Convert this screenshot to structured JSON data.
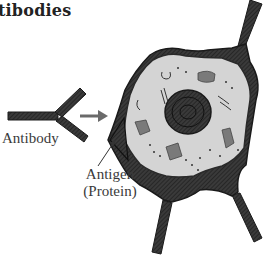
{
  "title": "tibodies",
  "labels": {
    "antibody": "Antibody",
    "antigen_line1": "Antigen",
    "antigen_line2": "(Protein)"
  },
  "colors": {
    "cytoplasm": "#d4d4d4",
    "membrane": "#2a2a2a",
    "antigen": "#3a3a3a",
    "organelle": "#7a7a7a",
    "arrow": "#6a6a6a"
  }
}
